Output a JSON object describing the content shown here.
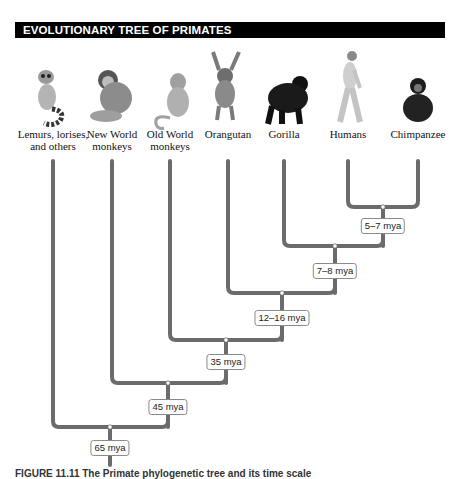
{
  "header": {
    "title": "EVOLUTIONARY TREE OF PRIMATES"
  },
  "taxa": [
    {
      "id": "lemurs",
      "line1": "Lemurs, lorises,",
      "line2": "and others",
      "icon": "lemur-icon",
      "x": 53
    },
    {
      "id": "new-world",
      "line1": "New World",
      "line2": "monkeys",
      "icon": "new-world-monkey-icon",
      "x": 112
    },
    {
      "id": "old-world",
      "line1": "Old World",
      "line2": "monkeys",
      "icon": "old-world-monkey-icon",
      "x": 170
    },
    {
      "id": "orangutan",
      "line1": "Orangutan",
      "line2": "",
      "icon": "orangutan-icon",
      "x": 228
    },
    {
      "id": "gorilla",
      "line1": "Gorilla",
      "line2": "",
      "icon": "gorilla-icon",
      "x": 284
    },
    {
      "id": "humans",
      "line1": "Humans",
      "line2": "",
      "icon": "human-icon",
      "x": 348
    },
    {
      "id": "chimpanzee",
      "line1": "Chimpanzee",
      "line2": "",
      "icon": "chimpanzee-icon",
      "x": 418
    }
  ],
  "divergences": [
    {
      "label": "5–7 mya",
      "joins": "Humans + Chimpanzee"
    },
    {
      "label": "7–8 mya",
      "joins": "Gorilla + (Humans, Chimpanzee)"
    },
    {
      "label": "12–16 mya",
      "joins": "Orangutan + African apes"
    },
    {
      "label": "35 mya",
      "joins": "Old World monkeys + apes"
    },
    {
      "label": "45 mya",
      "joins": "New World monkeys + catarrhines"
    },
    {
      "label": "65 mya",
      "joins": "Lemurs/lorises + anthropoids"
    }
  ],
  "colors": {
    "branch": "#6b6b6b",
    "header_bg": "#000000",
    "header_text": "#ffffff"
  },
  "caption": {
    "text": "FIGURE 11.11  The Primate phylogenetic tree and its time scale"
  }
}
